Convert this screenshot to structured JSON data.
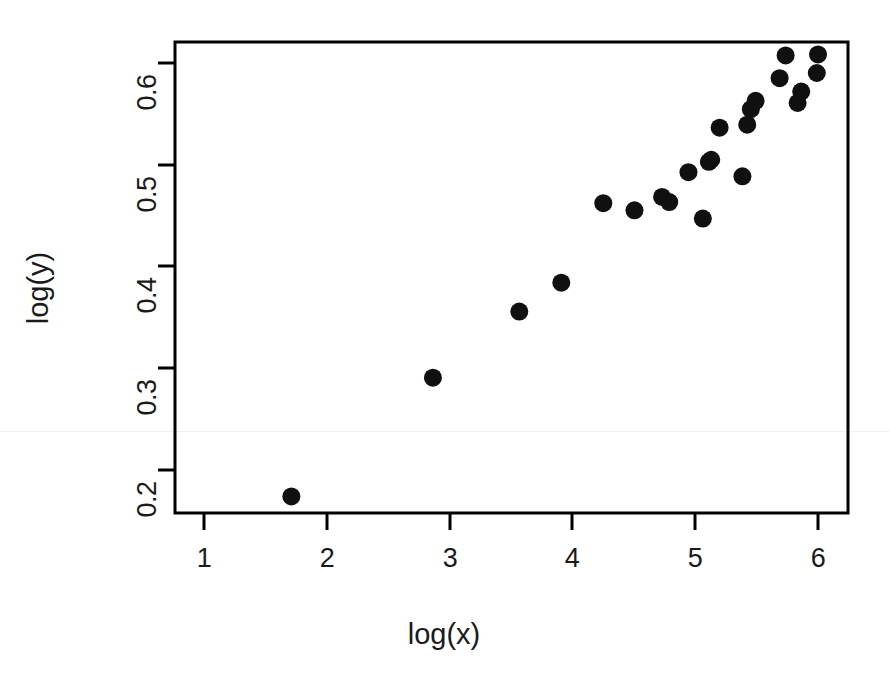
{
  "figure": {
    "background_color": "#ffffff",
    "foreground_color": "#000000",
    "point_color": "#101010"
  },
  "axes": {
    "x_title": "log(x)",
    "y_title": "log(y)",
    "x_tick_labels": [
      "1",
      "2",
      "3",
      "4",
      "5",
      "6"
    ],
    "y_tick_labels": [
      "0.2",
      "0.3",
      "0.4",
      "0.5",
      "0.6"
    ]
  },
  "chart_data": {
    "type": "scatter",
    "title": "",
    "xlabel": "log(x)",
    "ylabel": "log(y)",
    "xlim": [
      0.63,
      6.24
    ],
    "ylim": [
      0.157,
      0.613
    ],
    "xticks": [
      1,
      2,
      3,
      4,
      5,
      6
    ],
    "yticks": [
      0.2,
      0.3,
      0.4,
      0.5,
      0.6
    ],
    "grid": false,
    "legend": null,
    "marker": "filled-circle",
    "marker_size_px": 9,
    "points": [
      {
        "x": 1.6,
        "y": 0.173
      },
      {
        "x": 2.78,
        "y": 0.288
      },
      {
        "x": 3.5,
        "y": 0.352
      },
      {
        "x": 3.85,
        "y": 0.38
      },
      {
        "x": 4.2,
        "y": 0.457
      },
      {
        "x": 4.46,
        "y": 0.45
      },
      {
        "x": 4.69,
        "y": 0.463
      },
      {
        "x": 4.75,
        "y": 0.458
      },
      {
        "x": 4.91,
        "y": 0.487
      },
      {
        "x": 5.03,
        "y": 0.442
      },
      {
        "x": 5.08,
        "y": 0.497
      },
      {
        "x": 5.1,
        "y": 0.499
      },
      {
        "x": 5.17,
        "y": 0.53
      },
      {
        "x": 5.36,
        "y": 0.483
      },
      {
        "x": 5.4,
        "y": 0.533
      },
      {
        "x": 5.43,
        "y": 0.548
      },
      {
        "x": 5.47,
        "y": 0.556
      },
      {
        "x": 5.67,
        "y": 0.578
      },
      {
        "x": 5.72,
        "y": 0.6
      },
      {
        "x": 5.82,
        "y": 0.554
      },
      {
        "x": 5.85,
        "y": 0.565
      },
      {
        "x": 5.98,
        "y": 0.583
      },
      {
        "x": 5.99,
        "y": 0.601
      }
    ]
  },
  "geometry": {
    "plot_left_px": 175,
    "plot_right_px": 848,
    "plot_top_px": 42,
    "plot_bottom_px": 513,
    "x_tick_px": [
      204,
      327,
      450,
      572,
      695,
      818
    ],
    "y_tick_px": [
      470,
      368,
      266,
      165,
      63
    ]
  }
}
